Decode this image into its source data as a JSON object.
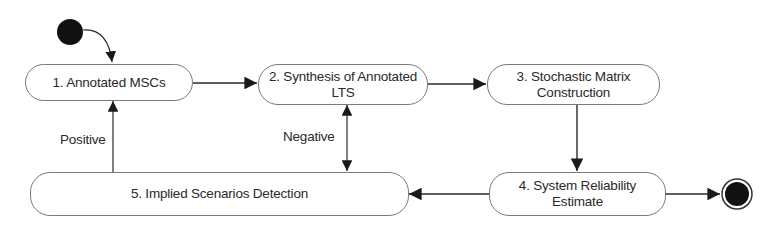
{
  "diagram": {
    "type": "uml-activity-diagram",
    "colors": {
      "line": "#2a2a2a",
      "node_border": "#7a7a7a",
      "text": "#2a2a2a",
      "fill": "#ffffff",
      "terminal": "#111111"
    },
    "start_node": {
      "label": "",
      "kind": "initial-state"
    },
    "end_node": {
      "label": "",
      "kind": "final-state"
    },
    "nodes": [
      {
        "id": "1",
        "label": "1. Annotated MSCs"
      },
      {
        "id": "2",
        "label": "2. Synthesis of Annotated\nLTS"
      },
      {
        "id": "3",
        "label": "3. Stochastic Matrix\nConstruction"
      },
      {
        "id": "4",
        "label": "4. System Reliability\nEstimate"
      },
      {
        "id": "5",
        "label": "5. Implied Scenarios Detection"
      }
    ],
    "edges": [
      {
        "from": "start",
        "to": "1",
        "label": ""
      },
      {
        "from": "1",
        "to": "2",
        "label": ""
      },
      {
        "from": "2",
        "to": "3",
        "label": ""
      },
      {
        "from": "3",
        "to": "4",
        "label": ""
      },
      {
        "from": "4",
        "to": "5",
        "label": ""
      },
      {
        "from": "4",
        "to": "end",
        "label": ""
      },
      {
        "from": "5",
        "to": "1",
        "label": "Positive"
      },
      {
        "from": "5",
        "to": "2",
        "label": "Negative",
        "bidirectional": true
      }
    ],
    "edge_labels": {
      "positive": "Positive",
      "negative": "Negative"
    }
  }
}
